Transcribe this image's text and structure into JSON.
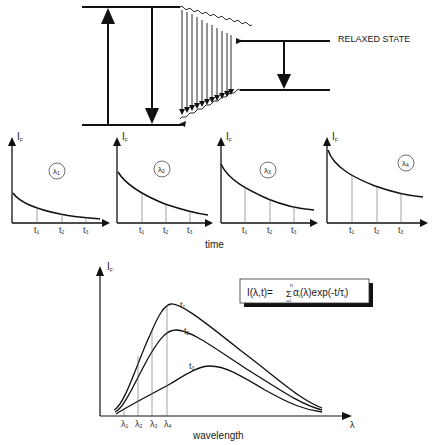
{
  "diagram": {
    "type": "fluorescence-decay-schematic",
    "energy_diagram": {
      "relaxed_state_label": "RELAXED STATE"
    },
    "decay_plots": [
      {
        "y_label": "I",
        "y_sub": "F",
        "wavelength": "λ",
        "wavelength_sub": "1",
        "t_labels": [
          "t",
          "t",
          "t"
        ],
        "t_subs": [
          "1",
          "2",
          "3"
        ]
      },
      {
        "y_label": "I",
        "y_sub": "F",
        "wavelength": "λ",
        "wavelength_sub": "2",
        "t_labels": [
          "t",
          "t",
          "t"
        ],
        "t_subs": [
          "1",
          "2",
          "3"
        ]
      },
      {
        "y_label": "I",
        "y_sub": "F",
        "wavelength": "λ",
        "wavelength_sub": "3",
        "t_labels": [
          "t",
          "t",
          "t"
        ],
        "t_subs": [
          "1",
          "2",
          "3"
        ]
      },
      {
        "y_label": "I",
        "y_sub": "F",
        "wavelength": "λ",
        "wavelength_sub": "4",
        "t_labels": [
          "t",
          "t",
          "t"
        ],
        "t_subs": [
          "1",
          "2",
          "3"
        ]
      }
    ],
    "time_axis_label": "time",
    "spectrum_plot": {
      "y_label": "I",
      "y_sub": "F",
      "x_label": "wavelength",
      "x_axis_symbol": "λ",
      "curve_labels": [
        {
          "label": "t",
          "sub": "1"
        },
        {
          "label": "t",
          "sub": "2"
        },
        {
          "label": "t",
          "sub": "3"
        }
      ],
      "wavelength_markers": [
        {
          "label": "λ",
          "sub": "1"
        },
        {
          "label": "λ",
          "sub": "2"
        },
        {
          "label": "λ",
          "sub": "3"
        },
        {
          "label": "λ",
          "sub": "4"
        }
      ],
      "equation": {
        "lhs": "I(λ,t)=",
        "sum_upper": "n",
        "sum_symbol": "Σ",
        "sum_lower": "i=1",
        "term": "α",
        "term_sub": "i",
        "rest": "(λ)exp(-t/τ",
        "tau_sub": "i",
        "close": ")"
      }
    }
  }
}
